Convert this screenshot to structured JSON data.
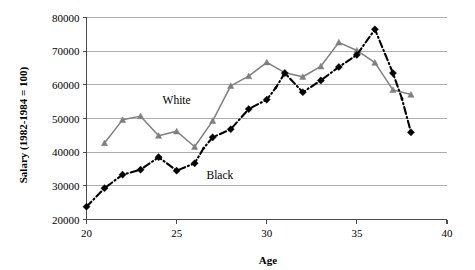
{
  "chart_data": {
    "type": "line",
    "title": "",
    "xlabel": "Age",
    "ylabel": "Salary (1982-1984 = 100)",
    "xlim": [
      20,
      40
    ],
    "ylim": [
      20000,
      80000
    ],
    "xticks": [
      "20",
      "25",
      "30",
      "35",
      "40"
    ],
    "xtick_values": [
      20,
      25,
      30,
      35,
      40
    ],
    "yticks": [
      "20000",
      "30000",
      "40000",
      "50000",
      "60000",
      "70000",
      "80000"
    ],
    "ytick_values": [
      20000,
      30000,
      40000,
      50000,
      60000,
      70000,
      80000
    ],
    "grid": true,
    "grid_axis": "y",
    "legend_position": "inline-annotations",
    "colors": {
      "white_series": "#7f7f7f",
      "black_series": "#000000",
      "gridline": "#9a9a9a",
      "axis": "#4a4a4a",
      "background": "#ffffff"
    },
    "annotations": [
      {
        "text": "White",
        "x": 25.0,
        "y": 54200
      },
      {
        "text": "Black",
        "x": 27.4,
        "y": 32100
      }
    ],
    "series": [
      {
        "name": "White",
        "marker": "triangle",
        "color": "#7f7f7f",
        "linestyle": "solid",
        "x": [
          21,
          22,
          23,
          24,
          25,
          26,
          27,
          28,
          29,
          30,
          31,
          32,
          33,
          34,
          35,
          36,
          37,
          38
        ],
        "values": [
          42700,
          49600,
          50700,
          44900,
          46200,
          41600,
          49300,
          59700,
          62600,
          66700,
          63600,
          62400,
          65500,
          72600,
          70200,
          66600,
          58500,
          57100
        ]
      },
      {
        "name": "Black",
        "marker": "diamond",
        "color": "#000000",
        "linestyle": "dash-dot",
        "x": [
          20,
          21,
          22,
          23,
          24,
          25,
          26,
          26.5,
          27,
          28,
          29,
          30,
          30.5,
          31,
          32,
          33,
          34,
          35,
          36,
          37,
          37.5,
          38
        ],
        "values": [
          23800,
          29300,
          33300,
          34800,
          38500,
          34500,
          36700,
          41200,
          44400,
          46800,
          52800,
          55600,
          59100,
          63500,
          57800,
          61300,
          65300,
          68900,
          76500,
          63500,
          55900,
          45900
        ]
      }
    ]
  }
}
